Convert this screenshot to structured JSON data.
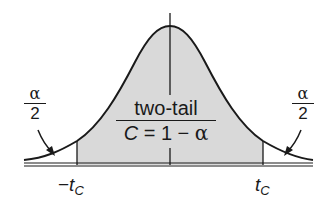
{
  "diagram": {
    "type": "t-distribution two-tailed critical region",
    "center_label": {
      "title": "two-tail",
      "formula_prefix": "C",
      "formula_eq": " = 1 − ",
      "formula_alpha": "α"
    },
    "left_tail": {
      "numerator": "α",
      "denominator": "2"
    },
    "right_tail": {
      "numerator": "α",
      "denominator": "2"
    },
    "axis_labels": {
      "left_minus": "−",
      "left_t": "t",
      "left_sub": "C",
      "right_t": "t",
      "right_sub": "C"
    },
    "colors": {
      "shade": "#d9d9d9",
      "line": "#1a1a1a",
      "background": "#ffffff"
    }
  }
}
